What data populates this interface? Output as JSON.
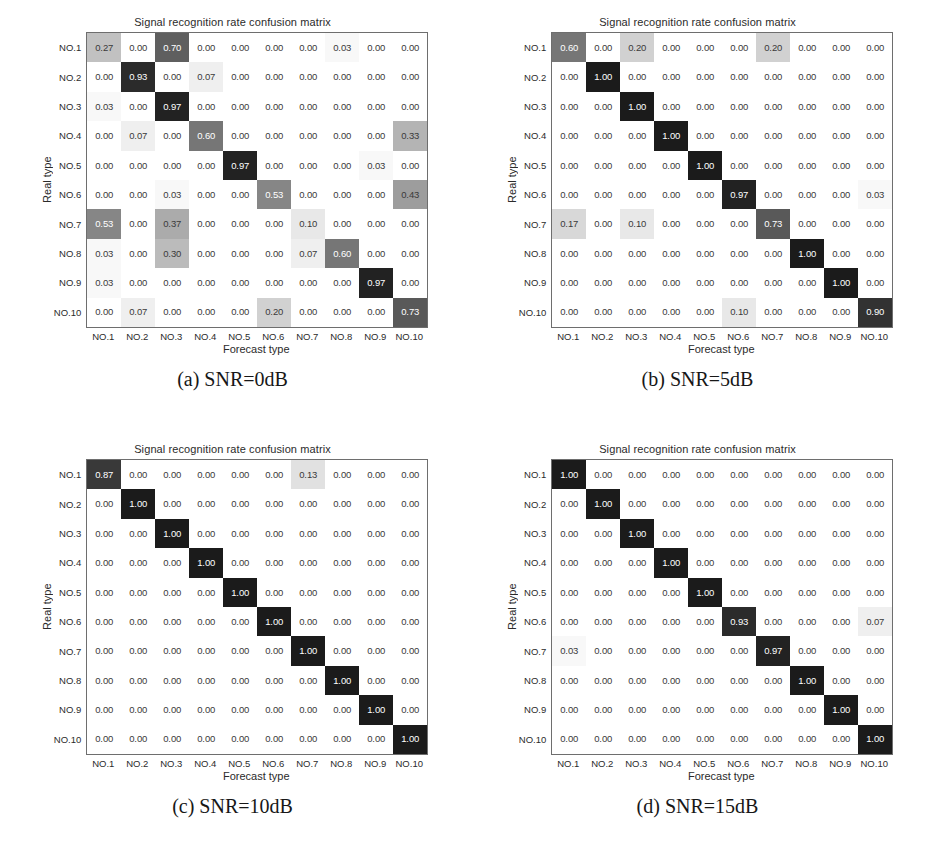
{
  "figure": {
    "panel_title": "Signal recognition rate confusion matrix",
    "xlabel": "Forecast type",
    "ylabel": "Real type",
    "class_labels": [
      "NO.1",
      "NO.2",
      "NO.3",
      "NO.4",
      "NO.5",
      "NO.6",
      "NO.7",
      "NO.8",
      "NO.9",
      "NO.10"
    ],
    "captions": [
      "(a) SNR=0dB",
      "(b) SNR=5dB",
      "(c) SNR=10dB",
      "(d) SNR=15dB"
    ],
    "colors": {
      "cell_max": "#2b2b2b",
      "cell_min": "#ffffff",
      "text_dark": "#3a3a3a",
      "text_light": "#ffffff",
      "border": "#6e6e6e"
    }
  },
  "chart_data": [
    {
      "type": "heatmap",
      "title": "Signal recognition rate confusion matrix",
      "subtitle": "(a) SNR=0dB",
      "xlabel": "Forecast type",
      "ylabel": "Real type",
      "xticklabels": [
        "NO.1",
        "NO.2",
        "NO.3",
        "NO.4",
        "NO.5",
        "NO.6",
        "NO.7",
        "NO.8",
        "NO.9",
        "NO.10"
      ],
      "yticklabels": [
        "NO.1",
        "NO.2",
        "NO.3",
        "NO.4",
        "NO.5",
        "NO.6",
        "NO.7",
        "NO.8",
        "NO.9",
        "NO.10"
      ],
      "zlim": [
        0,
        1
      ],
      "grid": false,
      "legend": "none",
      "values": [
        [
          0.27,
          0.0,
          0.7,
          0.0,
          0.0,
          0.0,
          0.0,
          0.03,
          0.0,
          0.0
        ],
        [
          0.0,
          0.93,
          0.0,
          0.07,
          0.0,
          0.0,
          0.0,
          0.0,
          0.0,
          0.0
        ],
        [
          0.03,
          0.0,
          0.97,
          0.0,
          0.0,
          0.0,
          0.0,
          0.0,
          0.0,
          0.0
        ],
        [
          0.0,
          0.07,
          0.0,
          0.6,
          0.0,
          0.0,
          0.0,
          0.0,
          0.0,
          0.33
        ],
        [
          0.0,
          0.0,
          0.0,
          0.0,
          0.97,
          0.0,
          0.0,
          0.0,
          0.03,
          0.0
        ],
        [
          0.0,
          0.0,
          0.03,
          0.0,
          0.0,
          0.53,
          0.0,
          0.0,
          0.0,
          0.43
        ],
        [
          0.53,
          0.0,
          0.37,
          0.0,
          0.0,
          0.0,
          0.1,
          0.0,
          0.0,
          0.0
        ],
        [
          0.03,
          0.0,
          0.3,
          0.0,
          0.0,
          0.0,
          0.07,
          0.6,
          0.0,
          0.0
        ],
        [
          0.03,
          0.0,
          0.0,
          0.0,
          0.0,
          0.0,
          0.0,
          0.0,
          0.97,
          0.0
        ],
        [
          0.0,
          0.07,
          0.0,
          0.0,
          0.0,
          0.2,
          0.0,
          0.0,
          0.0,
          0.73
        ]
      ]
    },
    {
      "type": "heatmap",
      "title": "Signal recognition rate confusion matrix",
      "subtitle": "(b) SNR=5dB",
      "xlabel": "Forecast type",
      "ylabel": "Real type",
      "xticklabels": [
        "NO.1",
        "NO.2",
        "NO.3",
        "NO.4",
        "NO.5",
        "NO.6",
        "NO.7",
        "NO.8",
        "NO.9",
        "NO.10"
      ],
      "yticklabels": [
        "NO.1",
        "NO.2",
        "NO.3",
        "NO.4",
        "NO.5",
        "NO.6",
        "NO.7",
        "NO.8",
        "NO.9",
        "NO.10"
      ],
      "zlim": [
        0,
        1
      ],
      "grid": false,
      "legend": "none",
      "values": [
        [
          0.6,
          0.0,
          0.2,
          0.0,
          0.0,
          0.0,
          0.2,
          0.0,
          0.0,
          0.0
        ],
        [
          0.0,
          1.0,
          0.0,
          0.0,
          0.0,
          0.0,
          0.0,
          0.0,
          0.0,
          0.0
        ],
        [
          0.0,
          0.0,
          1.0,
          0.0,
          0.0,
          0.0,
          0.0,
          0.0,
          0.0,
          0.0
        ],
        [
          0.0,
          0.0,
          0.0,
          1.0,
          0.0,
          0.0,
          0.0,
          0.0,
          0.0,
          0.0
        ],
        [
          0.0,
          0.0,
          0.0,
          0.0,
          1.0,
          0.0,
          0.0,
          0.0,
          0.0,
          0.0
        ],
        [
          0.0,
          0.0,
          0.0,
          0.0,
          0.0,
          0.97,
          0.0,
          0.0,
          0.0,
          0.03
        ],
        [
          0.17,
          0.0,
          0.1,
          0.0,
          0.0,
          0.0,
          0.73,
          0.0,
          0.0,
          0.0
        ],
        [
          0.0,
          0.0,
          0.0,
          0.0,
          0.0,
          0.0,
          0.0,
          1.0,
          0.0,
          0.0
        ],
        [
          0.0,
          0.0,
          0.0,
          0.0,
          0.0,
          0.0,
          0.0,
          0.0,
          1.0,
          0.0
        ],
        [
          0.0,
          0.0,
          0.0,
          0.0,
          0.0,
          0.1,
          0.0,
          0.0,
          0.0,
          0.9
        ]
      ]
    },
    {
      "type": "heatmap",
      "title": "Signal recognition rate confusion matrix",
      "subtitle": "(c) SNR=10dB",
      "xlabel": "Forecast type",
      "ylabel": "Real type",
      "xticklabels": [
        "NO.1",
        "NO.2",
        "NO.3",
        "NO.4",
        "NO.5",
        "NO.6",
        "NO.7",
        "NO.8",
        "NO.9",
        "NO.10"
      ],
      "yticklabels": [
        "NO.1",
        "NO.2",
        "NO.3",
        "NO.4",
        "NO.5",
        "NO.6",
        "NO.7",
        "NO.8",
        "NO.9",
        "NO.10"
      ],
      "zlim": [
        0,
        1
      ],
      "grid": false,
      "legend": "none",
      "values": [
        [
          0.87,
          0.0,
          0.0,
          0.0,
          0.0,
          0.0,
          0.13,
          0.0,
          0.0,
          0.0
        ],
        [
          0.0,
          1.0,
          0.0,
          0.0,
          0.0,
          0.0,
          0.0,
          0.0,
          0.0,
          0.0
        ],
        [
          0.0,
          0.0,
          1.0,
          0.0,
          0.0,
          0.0,
          0.0,
          0.0,
          0.0,
          0.0
        ],
        [
          0.0,
          0.0,
          0.0,
          1.0,
          0.0,
          0.0,
          0.0,
          0.0,
          0.0,
          0.0
        ],
        [
          0.0,
          0.0,
          0.0,
          0.0,
          1.0,
          0.0,
          0.0,
          0.0,
          0.0,
          0.0
        ],
        [
          0.0,
          0.0,
          0.0,
          0.0,
          0.0,
          1.0,
          0.0,
          0.0,
          0.0,
          0.0
        ],
        [
          0.0,
          0.0,
          0.0,
          0.0,
          0.0,
          0.0,
          1.0,
          0.0,
          0.0,
          0.0
        ],
        [
          0.0,
          0.0,
          0.0,
          0.0,
          0.0,
          0.0,
          0.0,
          1.0,
          0.0,
          0.0
        ],
        [
          0.0,
          0.0,
          0.0,
          0.0,
          0.0,
          0.0,
          0.0,
          0.0,
          1.0,
          0.0
        ],
        [
          0.0,
          0.0,
          0.0,
          0.0,
          0.0,
          0.0,
          0.0,
          0.0,
          0.0,
          1.0
        ]
      ]
    },
    {
      "type": "heatmap",
      "title": "Signal recognition rate confusion matrix",
      "subtitle": "(d) SNR=15dB",
      "xlabel": "Forecast type",
      "ylabel": "Real type",
      "xticklabels": [
        "NO.1",
        "NO.2",
        "NO.3",
        "NO.4",
        "NO.5",
        "NO.6",
        "NO.7",
        "NO.8",
        "NO.9",
        "NO.10"
      ],
      "yticklabels": [
        "NO.1",
        "NO.2",
        "NO.3",
        "NO.4",
        "NO.5",
        "NO.6",
        "NO.7",
        "NO.8",
        "NO.9",
        "NO.10"
      ],
      "zlim": [
        0,
        1
      ],
      "grid": false,
      "legend": "none",
      "values": [
        [
          1.0,
          0.0,
          0.0,
          0.0,
          0.0,
          0.0,
          0.0,
          0.0,
          0.0,
          0.0
        ],
        [
          0.0,
          1.0,
          0.0,
          0.0,
          0.0,
          0.0,
          0.0,
          0.0,
          0.0,
          0.0
        ],
        [
          0.0,
          0.0,
          1.0,
          0.0,
          0.0,
          0.0,
          0.0,
          0.0,
          0.0,
          0.0
        ],
        [
          0.0,
          0.0,
          0.0,
          1.0,
          0.0,
          0.0,
          0.0,
          0.0,
          0.0,
          0.0
        ],
        [
          0.0,
          0.0,
          0.0,
          0.0,
          1.0,
          0.0,
          0.0,
          0.0,
          0.0,
          0.0
        ],
        [
          0.0,
          0.0,
          0.0,
          0.0,
          0.0,
          0.93,
          0.0,
          0.0,
          0.0,
          0.07
        ],
        [
          0.03,
          0.0,
          0.0,
          0.0,
          0.0,
          0.0,
          0.97,
          0.0,
          0.0,
          0.0
        ],
        [
          0.0,
          0.0,
          0.0,
          0.0,
          0.0,
          0.0,
          0.0,
          1.0,
          0.0,
          0.0
        ],
        [
          0.0,
          0.0,
          0.0,
          0.0,
          0.0,
          0.0,
          0.0,
          0.0,
          1.0,
          0.0
        ],
        [
          0.0,
          0.0,
          0.0,
          0.0,
          0.0,
          0.0,
          0.0,
          0.0,
          0.0,
          1.0
        ]
      ]
    }
  ]
}
